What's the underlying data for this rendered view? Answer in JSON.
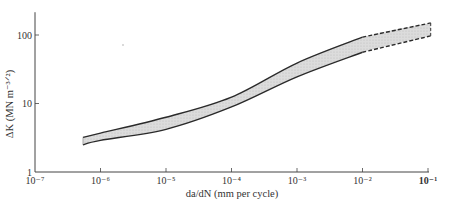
{
  "chart_data": {
    "type": "area",
    "title": "",
    "xlabel": "da/dN (mm per cycle)",
    "ylabel": "ΔK (MN m⁻³ᐟ²)",
    "xscale": "log",
    "yscale": "log",
    "xlim": [
      1e-07,
      0.1
    ],
    "ylim": [
      1,
      215
    ],
    "grid": false,
    "x_ticks": [
      "10⁻⁷",
      "10⁻⁶",
      "10⁻⁵",
      "10⁻⁴",
      "10⁻³",
      "10⁻²",
      "10⁻¹"
    ],
    "x_tick_values": [
      1e-07,
      1e-06,
      1e-05,
      0.0001,
      0.001,
      0.01,
      0.1
    ],
    "y_ticks": [
      "1",
      "10",
      "100"
    ],
    "y_tick_values": [
      1,
      10,
      100
    ],
    "series": [
      {
        "name": "upper bound",
        "style": "solid to 1e-2, dashed beyond",
        "x": [
          5.4e-07,
          1e-06,
          1e-05,
          0.0001,
          0.001,
          0.01,
          0.11
        ],
        "values": [
          3.2,
          3.7,
          6.3,
          12.4,
          39,
          93,
          150
        ]
      },
      {
        "name": "lower bound",
        "style": "solid to 1e-2, dashed beyond",
        "x": [
          5.4e-07,
          1e-06,
          1e-05,
          0.0001,
          0.001,
          0.01,
          0.11
        ],
        "values": [
          2.5,
          2.9,
          4.2,
          8.9,
          24.5,
          56,
          97
        ]
      }
    ],
    "band_fill": "#d4d4d4",
    "line_color": "#2a2a2a",
    "dashed_from_x": 0.01
  },
  "axes": {
    "x_label_prefix": "da/dN",
    "x_label_units": "(mm per cycle)",
    "y_label_prefix": "ΔK",
    "y_label_units": "(MN m⁻³ᐟ²)"
  }
}
